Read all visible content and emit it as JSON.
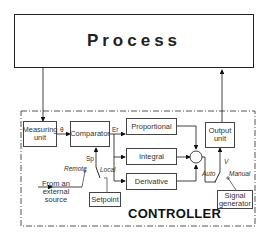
{
  "process": {
    "label": "Process"
  },
  "controller": {
    "title": "CONTROLLER",
    "blocks": {
      "measuring_unit": "Measuring unit",
      "comparator": "Comparator",
      "proportional": "Proportional",
      "integral": "Integral",
      "derivative": "Derivative",
      "output_unit": "Output unit",
      "setpoint": "Setpoint",
      "signal_generator": "Signal generator"
    },
    "signals": {
      "measured": "θ",
      "error": "Er",
      "setpoint": "Sp",
      "output": "V",
      "summing": "+"
    },
    "switch_labels": {
      "remote": "Remote",
      "local": "Local",
      "auto": "Auto",
      "manual": "Manual"
    },
    "external_source": "From an external source"
  }
}
